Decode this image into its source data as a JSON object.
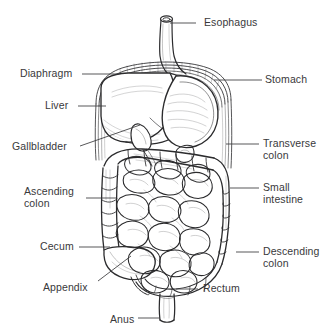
{
  "figure": {
    "style": "pen-and-ink line drawing",
    "background_color": "#ffffff",
    "ink_color": "#2b2b2d",
    "text_color": "#39393b"
  },
  "labels": [
    {
      "id": "esophagus",
      "text": "Esophagus",
      "side": "right",
      "x": 204,
      "y": 17,
      "leader": {
        "x1": 196,
        "y1": 23,
        "x2": 170,
        "y2": 23
      }
    },
    {
      "id": "stomach",
      "text": "Stomach",
      "side": "right",
      "x": 265,
      "y": 74,
      "leader": {
        "x1": 262,
        "y1": 80,
        "x2": 214,
        "y2": 80
      }
    },
    {
      "id": "transverse-colon",
      "text": "Transverse\ncolon",
      "side": "right",
      "x": 263,
      "y": 138,
      "leader": {
        "x1": 259,
        "y1": 144,
        "x2": 226,
        "y2": 144
      }
    },
    {
      "id": "small-intestine",
      "text": "Small\nintestine",
      "side": "right",
      "x": 263,
      "y": 182,
      "leader": {
        "x1": 259,
        "y1": 188,
        "x2": 230,
        "y2": 188
      }
    },
    {
      "id": "descending-colon",
      "text": "Descending\ncolon",
      "side": "right",
      "x": 263,
      "y": 246,
      "leader": {
        "x1": 259,
        "y1": 252,
        "x2": 236,
        "y2": 252
      }
    },
    {
      "id": "rectum",
      "text": "Rectum",
      "side": "right",
      "x": 203,
      "y": 283,
      "leader": {
        "x1": 198,
        "y1": 289,
        "x2": 176,
        "y2": 289
      }
    },
    {
      "id": "diaphragm",
      "text": "Diaphragm",
      "side": "left",
      "x": 20,
      "y": 68,
      "leader": {
        "x1": 82,
        "y1": 74,
        "x2": 118,
        "y2": 74
      }
    },
    {
      "id": "liver",
      "text": "Liver",
      "side": "left",
      "x": 45,
      "y": 100,
      "leader": {
        "x1": 78,
        "y1": 106,
        "x2": 106,
        "y2": 106
      }
    },
    {
      "id": "gallbladder",
      "text": "Gallbladder",
      "side": "left",
      "x": 12,
      "y": 141,
      "leader": {
        "x1": 80,
        "y1": 146,
        "x2": 140,
        "y2": 125
      }
    },
    {
      "id": "ascending-colon",
      "text": "Ascending\ncolon",
      "side": "left",
      "x": 24,
      "y": 186,
      "leader": {
        "x1": 86,
        "y1": 198,
        "x2": 116,
        "y2": 198
      }
    },
    {
      "id": "cecum",
      "text": "Cecum",
      "side": "left",
      "x": 40,
      "y": 241,
      "leader": {
        "x1": 79,
        "y1": 247,
        "x2": 110,
        "y2": 247
      }
    },
    {
      "id": "appendix",
      "text": "Appendix",
      "side": "left",
      "x": 43,
      "y": 282,
      "leader": {
        "x1": 98,
        "y1": 281,
        "x2": 131,
        "y2": 256
      }
    },
    {
      "id": "anus",
      "text": "Anus",
      "side": "left",
      "x": 110,
      "y": 314,
      "leader": {
        "x1": 138,
        "y1": 318,
        "x2": 160,
        "y2": 318
      }
    }
  ],
  "organs": [
    {
      "id": "esophagus",
      "name": "Esophagus"
    },
    {
      "id": "stomach",
      "name": "Stomach"
    },
    {
      "id": "diaphragm",
      "name": "Diaphragm"
    },
    {
      "id": "liver",
      "name": "Liver"
    },
    {
      "id": "gallbladder",
      "name": "Gallbladder"
    },
    {
      "id": "transverse-colon",
      "name": "Transverse colon"
    },
    {
      "id": "ascending-colon",
      "name": "Ascending colon"
    },
    {
      "id": "descending-colon",
      "name": "Descending colon"
    },
    {
      "id": "small-intestine",
      "name": "Small intestine"
    },
    {
      "id": "cecum",
      "name": "Cecum"
    },
    {
      "id": "appendix",
      "name": "Appendix"
    },
    {
      "id": "rectum",
      "name": "Rectum"
    },
    {
      "id": "anus",
      "name": "Anus"
    }
  ]
}
